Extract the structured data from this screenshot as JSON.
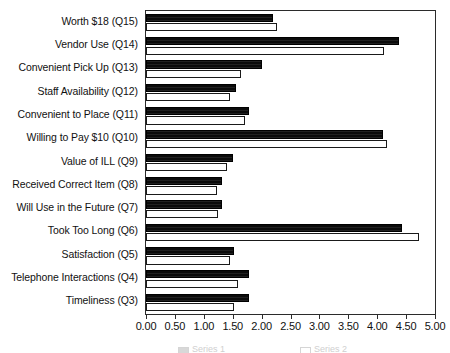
{
  "chart_data": {
    "type": "bar",
    "orientation": "horizontal",
    "title": "",
    "subtitle": "",
    "xlabel": "",
    "ylabel": "",
    "xlim": [
      0.0,
      5.0
    ],
    "xtick_step": 0.5,
    "grid": false,
    "legend_position": "bottom",
    "categories": [
      "Worth $18 (Q15)",
      "Vendor Use (Q14)",
      "Convenient Pick Up (Q13)",
      "Staff Availability (Q12)",
      "Convenient to Place (Q11)",
      "Willing to Pay $10 (Q10)",
      "Value of ILL (Q9)",
      "Received Correct Item (Q8)",
      "Will Use in the Future (Q7)",
      "Took Too Long (Q6)",
      "Satisfaction (Q5)",
      "Telephone Interactions (Q4)",
      "Timeliness (Q3)"
    ],
    "tick_labels": [
      "0.00",
      "0.50",
      "1.00",
      "1.50",
      "2.00",
      "2.50",
      "3.00",
      "3.50",
      "4.00",
      "4.50",
      "5.00"
    ],
    "tick_values": [
      0.0,
      0.5,
      1.0,
      1.5,
      2.0,
      2.5,
      3.0,
      3.5,
      4.0,
      4.5,
      5.0
    ],
    "series": [
      {
        "name": "Series 1",
        "style": "dark",
        "color": "#0b0b0b",
        "values": [
          2.19,
          4.38,
          2.0,
          1.55,
          1.79,
          4.1,
          1.5,
          1.31,
          1.31,
          4.43,
          1.52,
          1.79,
          1.79
        ]
      },
      {
        "name": "Series 2",
        "style": "light",
        "color": "#ffffff",
        "values": [
          2.26,
          4.12,
          1.65,
          1.45,
          1.72,
          4.17,
          1.41,
          1.22,
          1.24,
          4.72,
          1.45,
          1.59,
          1.53
        ]
      }
    ]
  },
  "legend": {
    "entries": [
      {
        "label": "Series 1",
        "style": "dark"
      },
      {
        "label": "Series 2",
        "style": "light"
      }
    ]
  }
}
